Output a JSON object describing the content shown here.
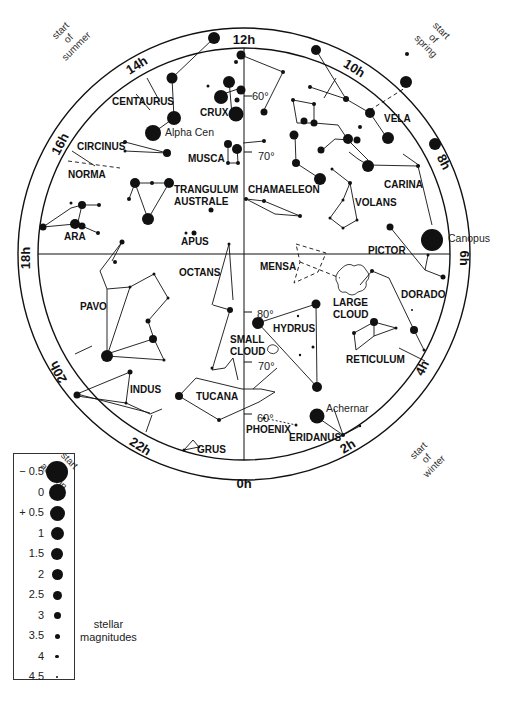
{
  "chart_title": "Southern sky star map",
  "hour_labels": [
    {
      "label": "12h",
      "x": 244,
      "y": 40,
      "rot": 0
    },
    {
      "label": "14h",
      "x": 139,
      "y": 65,
      "rot": -32
    },
    {
      "label": "16h",
      "x": 64,
      "y": 142,
      "rot": -62
    },
    {
      "label": "18h",
      "x": 30,
      "y": 254,
      "rot": -90
    },
    {
      "label": "20h",
      "x": 62,
      "y": 366,
      "rot": -118
    },
    {
      "label": "22h",
      "x": 138,
      "y": 446,
      "rot": 32
    },
    {
      "label": "0h",
      "x": 244,
      "y": 484,
      "rot": 0
    },
    {
      "label": "2h",
      "x": 350,
      "y": 446,
      "rot": -32
    },
    {
      "label": "4h",
      "x": 426,
      "y": 366,
      "rot": -62
    },
    {
      "label": "6h",
      "x": 460,
      "y": 254,
      "rot": 90
    },
    {
      "label": "8h",
      "x": 440,
      "y": 160,
      "rot": 62
    },
    {
      "label": "10h",
      "x": 352,
      "y": 68,
      "rot": 32
    }
  ],
  "season_labels": [
    {
      "lines": [
        "start",
        "of",
        "summer"
      ],
      "x": 70,
      "y": 40,
      "rot": -45
    },
    {
      "lines": [
        "start",
        "of",
        "spring"
      ],
      "x": 432,
      "y": 40,
      "rot": 45
    },
    {
      "lines": [
        "start",
        "of",
        "autumn"
      ],
      "x": 60,
      "y": 470,
      "rot": 45
    },
    {
      "lines": [
        "start",
        "of",
        "winter"
      ],
      "x": 428,
      "y": 460,
      "rot": -45
    }
  ],
  "declination_labels": [
    {
      "label": "60°",
      "x": 252,
      "y": 96
    },
    {
      "label": "70°",
      "x": 258,
      "y": 156
    },
    {
      "label": "80°",
      "x": 257,
      "y": 314
    },
    {
      "label": "70°",
      "x": 258,
      "y": 366
    },
    {
      "label": "60°",
      "x": 257,
      "y": 418
    }
  ],
  "constellations": [
    {
      "label": "CENTAURUS",
      "x": 112,
      "y": 105
    },
    {
      "label": "CRUX",
      "x": 200,
      "y": 116
    },
    {
      "label": "CIRCINUS",
      "x": 77,
      "y": 150
    },
    {
      "label": "NORMA",
      "x": 68,
      "y": 178
    },
    {
      "label": "MUSCA",
      "x": 188,
      "y": 162
    },
    {
      "label": "TRANGULUM",
      "x": 174,
      "y": 193
    },
    {
      "label": "AUSTRALE",
      "x": 174,
      "y": 205
    },
    {
      "label": "CHAMAELEON",
      "x": 248,
      "y": 193
    },
    {
      "label": "VELA",
      "x": 384,
      "y": 122
    },
    {
      "label": "CARINA",
      "x": 384,
      "y": 188
    },
    {
      "label": "VOLANS",
      "x": 355,
      "y": 206
    },
    {
      "label": "ARA",
      "x": 64,
      "y": 240
    },
    {
      "label": "APUS",
      "x": 181,
      "y": 245
    },
    {
      "label": "PICTOR",
      "x": 368,
      "y": 254
    },
    {
      "label": "MENSA",
      "x": 260,
      "y": 270
    },
    {
      "label": "OCTANS",
      "x": 179,
      "y": 276
    },
    {
      "label": "PAVO",
      "x": 80,
      "y": 310
    },
    {
      "label": "LARGE",
      "x": 333,
      "y": 306
    },
    {
      "label": "CLOUD",
      "x": 333,
      "y": 318
    },
    {
      "label": "DORADO",
      "x": 401,
      "y": 298
    },
    {
      "label": "HYDRUS",
      "x": 273,
      "y": 332
    },
    {
      "label": "SMALL",
      "x": 230,
      "y": 343
    },
    {
      "label": "CLOUD",
      "x": 230,
      "y": 355
    },
    {
      "label": "RETICULUM",
      "x": 346,
      "y": 363
    },
    {
      "label": "INDUS",
      "x": 130,
      "y": 393
    },
    {
      "label": "TUCANA",
      "x": 196,
      "y": 400
    },
    {
      "label": "PHOENIX",
      "x": 246,
      "y": 433
    },
    {
      "label": "ERIDANUS",
      "x": 289,
      "y": 441
    },
    {
      "label": "GRUS",
      "x": 197,
      "y": 453
    }
  ],
  "star_names": [
    {
      "label": "Alpha Cen",
      "x": 165,
      "y": 136
    },
    {
      "label": "Canopus",
      "x": 448,
      "y": 242
    },
    {
      "label": "Achernar",
      "x": 326,
      "y": 412
    }
  ],
  "legend": {
    "rows": [
      {
        "mag": "− 0.5",
        "size": 22
      },
      {
        "mag": "0",
        "size": 17
      },
      {
        "mag": "+ 0.5",
        "size": 15
      },
      {
        "mag": "1",
        "size": 13
      },
      {
        "mag": "1.5",
        "size": 12
      },
      {
        "mag": "2",
        "size": 11
      },
      {
        "mag": "2.5",
        "size": 9
      },
      {
        "mag": "3",
        "size": 7
      },
      {
        "mag": "3.5",
        "size": 5
      },
      {
        "mag": "4",
        "size": 3.5
      },
      {
        "mag": "4.5",
        "size": 2
      }
    ],
    "caption_line1": "stellar",
    "caption_line2": "magnitudes"
  }
}
